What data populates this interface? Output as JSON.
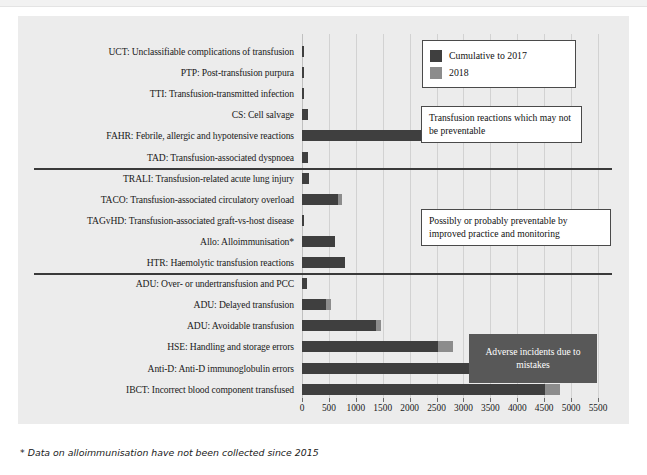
{
  "figure": {
    "footnote": "* Data on alloimmunisation have not been collected since 2015",
    "legend": {
      "items": [
        {
          "label": "Cumulative to 2017",
          "color": "#3f3f3f",
          "swatch_name": "legend-swatch-cumulative"
        },
        {
          "label": "2018",
          "color": "#8c8c8c",
          "swatch_name": "legend-swatch-2018"
        }
      ]
    },
    "annotations": [
      {
        "id": "reactions",
        "text": "Transfusion reactions which may not be preventable",
        "style": "light"
      },
      {
        "id": "preventable",
        "text": "Possibly or probably preventable by improved practice and monitoring",
        "style": "light"
      },
      {
        "id": "mistakes",
        "text": "Adverse incidents due to mistakes",
        "style": "dark",
        "bg": "#585858"
      }
    ]
  },
  "chart_data": {
    "type": "bar",
    "orientation": "horizontal",
    "stacked": true,
    "title": "",
    "xlabel": "",
    "ylabel": "",
    "xlim": [
      0,
      5500
    ],
    "xticks": [
      0,
      500,
      1000,
      1500,
      2000,
      2500,
      3000,
      3500,
      4000,
      4500,
      5000,
      5500
    ],
    "xtick_labels": [
      "0",
      "500",
      "1000",
      "1500",
      "2000",
      "2500",
      "3000",
      "3500",
      "4000",
      "4500",
      "5000",
      "5500"
    ],
    "grid": true,
    "legend_position": "top-right",
    "series": [
      {
        "name": "Cumulative to 2017",
        "color": "#3f3f3f"
      },
      {
        "name": "2018",
        "color": "#8c8c8c"
      }
    ],
    "categories": [
      "UCT: Unclassifiable complications of transfusion",
      "PTP: Post-transfusion purpura",
      "TTI: Transfusion-transmitted infection",
      "CS: Cell salvage",
      "FAHR: Febrile, allergic and hypotensive reactions",
      "TAD: Transfusion-associated dyspnoea",
      "TRALI: Transfusion-related acute lung injury",
      "TACO: Transfusion-associated circulatory overload",
      "TAGvHD: Transfusion-associated graft-vs-host disease",
      "Allo: Alloimmunisation*",
      "HTR: Haemolytic transfusion reactions",
      "ADU: Over- or undertransfusion and PCC",
      "ADU: Delayed transfusion",
      "ADU: Avoidable transfusion",
      "HSE: Handling and storage errors",
      "Anti-D: Anti-D immunoglobulin errors",
      "IBCT: Incorrect blood component transfused"
    ],
    "bars": [
      {
        "category": "UCT: Unclassifiable complications of transfusion",
        "cumulative_to_2017": 30,
        "y2018": 0,
        "total": 30
      },
      {
        "category": "PTP: Post-transfusion purpura",
        "cumulative_to_2017": 20,
        "y2018": 0,
        "total": 20
      },
      {
        "category": "TTI: Transfusion-transmitted infection",
        "cumulative_to_2017": 45,
        "y2018": 0,
        "total": 45
      },
      {
        "category": "CS: Cell salvage",
        "cumulative_to_2017": 120,
        "y2018": 0,
        "total": 120
      },
      {
        "category": "FAHR: Febrile, allergic and hypotensive reactions",
        "cumulative_to_2017": 3900,
        "y2018": 225,
        "total": 4125
      },
      {
        "category": "TAD: Transfusion-associated dyspnoea",
        "cumulative_to_2017": 110,
        "y2018": 0,
        "total": 110
      },
      {
        "category": "TRALI: Transfusion-related acute lung injury",
        "cumulative_to_2017": 130,
        "y2018": 0,
        "total": 130
      },
      {
        "category": "TACO: Transfusion-associated circulatory overload",
        "cumulative_to_2017": 670,
        "y2018": 70,
        "total": 740
      },
      {
        "category": "TAGvHD: Transfusion-associated graft-vs-host disease",
        "cumulative_to_2017": 12,
        "y2018": 0,
        "total": 12
      },
      {
        "category": "Allo: Alloimmunisation*",
        "cumulative_to_2017": 610,
        "y2018": 0,
        "total": 610
      },
      {
        "category": "HTR: Haemolytic transfusion reactions",
        "cumulative_to_2017": 790,
        "y2018": 0,
        "total": 790
      },
      {
        "category": "ADU: Over- or undertransfusion and PCC",
        "cumulative_to_2017": 90,
        "y2018": 0,
        "total": 90
      },
      {
        "category": "ADU: Delayed transfusion",
        "cumulative_to_2017": 440,
        "y2018": 100,
        "total": 540
      },
      {
        "category": "ADU: Avoidable transfusion",
        "cumulative_to_2017": 1370,
        "y2018": 95,
        "total": 1465
      },
      {
        "category": "HSE: Handling and storage errors",
        "cumulative_to_2017": 2520,
        "y2018": 280,
        "total": 2800
      },
      {
        "category": "Anti-D: Anti-D immunoglobulin errors",
        "cumulative_to_2017": 3250,
        "y2018": 370,
        "total": 3620
      },
      {
        "category": "IBCT: Incorrect blood component transfused",
        "cumulative_to_2017": 4515,
        "y2018": 280,
        "total": 4795
      }
    ],
    "group_separators_after": [
      5,
      10
    ]
  }
}
